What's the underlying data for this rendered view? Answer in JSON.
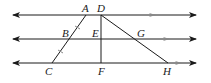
{
  "diagram": {
    "colors": {
      "line": "#1a1a1a",
      "parallel_marker": "#888888",
      "background": "#ffffff"
    },
    "parallel_lines": [
      {
        "name": "top-line",
        "y": 15,
        "x1": 12,
        "x2": 197,
        "marker_x": 152
      },
      {
        "name": "middle-line",
        "y": 39,
        "x1": 12,
        "x2": 197,
        "marker_x": 166
      },
      {
        "name": "bottom-line",
        "y": 63,
        "x1": 12,
        "x2": 197,
        "marker_x": 178
      }
    ],
    "points": {
      "A": {
        "label": "A",
        "x": 86,
        "y": 15
      },
      "B": {
        "label": "B",
        "x": 69,
        "y": 39
      },
      "C": {
        "label": "C",
        "x": 52,
        "y": 63
      },
      "D": {
        "label": "D",
        "x": 101,
        "y": 15
      },
      "E": {
        "label": "E",
        "x": 101,
        "y": 39
      },
      "F": {
        "label": "F",
        "x": 101,
        "y": 63
      },
      "G": {
        "label": "G",
        "x": 135,
        "y": 39
      },
      "H": {
        "label": "H",
        "x": 168,
        "y": 63
      }
    },
    "segments": [
      {
        "name": "segment-AC",
        "from": "A",
        "to": "C"
      },
      {
        "name": "segment-DF",
        "from": "D",
        "to": "F"
      },
      {
        "name": "segment-DH",
        "from": "D",
        "to": "H"
      }
    ],
    "tick_marks": [
      {
        "segment": "AB",
        "count": 1
      },
      {
        "segment": "BC",
        "count": 1
      }
    ]
  }
}
